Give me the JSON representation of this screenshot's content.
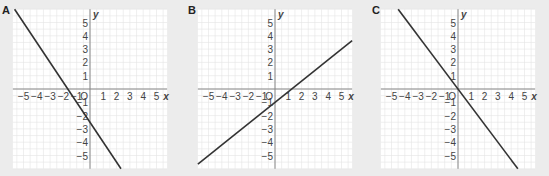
{
  "chart_data": [
    {
      "type": "line",
      "title": "A",
      "xlabel": "x",
      "ylabel": "y",
      "xlim": [
        -5.8,
        5.8
      ],
      "ylim": [
        -6,
        6
      ],
      "x_ticks": [
        -5,
        -4,
        -3,
        -2,
        -1,
        1,
        2,
        3,
        4,
        5
      ],
      "y_ticks": [
        -5,
        -4,
        -3,
        -2,
        -1,
        1,
        2,
        3,
        4,
        5
      ],
      "origin_label": "O",
      "grid": true,
      "series": [
        {
          "name": "line A",
          "slope": -1.5,
          "intercept": -2.5,
          "x": [
            -5.67,
            2.33
          ],
          "y": [
            6,
            -6
          ]
        }
      ]
    },
    {
      "type": "line",
      "title": "B",
      "xlabel": "x",
      "ylabel": "y",
      "xlim": [
        -5.8,
        5.8
      ],
      "ylim": [
        -6,
        6
      ],
      "x_ticks": [
        -5,
        -4,
        -3,
        -2,
        -1,
        1,
        2,
        3,
        4,
        5
      ],
      "y_ticks": [
        -5,
        -4,
        -3,
        -2,
        -1,
        1,
        2,
        3,
        4,
        5
      ],
      "origin_label": "O",
      "grid": true,
      "series": [
        {
          "name": "line B",
          "slope": 0.8,
          "intercept": -1,
          "x": [
            -5.8,
            5.8
          ],
          "y": [
            -5.64,
            3.64
          ]
        }
      ]
    },
    {
      "type": "line",
      "title": "C",
      "xlabel": "x",
      "ylabel": "y",
      "xlim": [
        -5.8,
        5.8
      ],
      "ylim": [
        -6,
        6
      ],
      "x_ticks": [
        -5,
        -4,
        -3,
        -2,
        -1,
        1,
        2,
        3,
        4,
        5
      ],
      "y_ticks": [
        -5,
        -4,
        -3,
        -2,
        -1,
        1,
        2,
        3,
        4,
        5
      ],
      "origin_label": "O",
      "grid": true,
      "series": [
        {
          "name": "line C",
          "slope": -1.33,
          "intercept": 0,
          "x": [
            -4.5,
            4.5
          ],
          "y": [
            6,
            -6
          ]
        }
      ]
    }
  ],
  "panels": [
    {
      "label": "A"
    },
    {
      "label": "B"
    },
    {
      "label": "C"
    }
  ],
  "axes": {
    "x_label": "x",
    "y_label": "y",
    "origin": "O"
  }
}
